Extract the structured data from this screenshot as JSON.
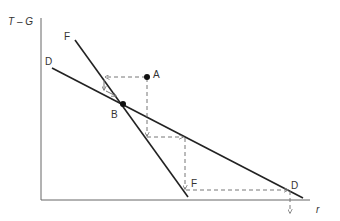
{
  "diagram": {
    "axes": {
      "y_label": "T – G",
      "x_label": "r",
      "color": "#555555"
    },
    "curves": [
      {
        "id": "F",
        "label_start": "F",
        "label_end": "F",
        "color": "#222222"
      },
      {
        "id": "D",
        "label_start": "D",
        "label_end": "D",
        "color": "#222222"
      }
    ],
    "points": [
      {
        "id": "A",
        "label": "A"
      },
      {
        "id": "B",
        "label": "B"
      }
    ],
    "dashed_path_color": "#777777",
    "arrow_color": "#777777"
  }
}
